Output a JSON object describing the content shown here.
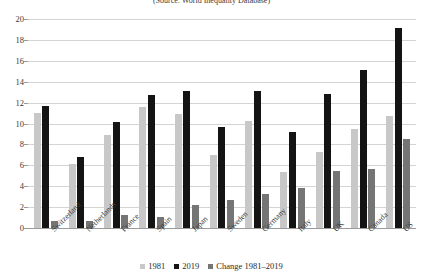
{
  "chart_data": {
    "type": "bar",
    "title": "(Source: World Inequality Database)",
    "xlabel": "",
    "ylabel": "",
    "ylim": [
      0,
      20
    ],
    "yticks": [
      0,
      2,
      4,
      6,
      8,
      10,
      12,
      14,
      16,
      18,
      20
    ],
    "grid": true,
    "legend_position": "bottom",
    "categories": [
      "Switzerland",
      "Netherlands",
      "France",
      "Spain",
      "Japan",
      "Sweden",
      "Germany",
      "Italy",
      "UK",
      "Canada",
      "US"
    ],
    "series": [
      {
        "name": "1981",
        "color": "#c8c8c8",
        "values": [
          11.0,
          6.1,
          8.9,
          11.6,
          10.9,
          7.0,
          10.2,
          5.4,
          7.3,
          9.5,
          10.7
        ]
      },
      {
        "name": "2019",
        "color": "#141414",
        "values": [
          11.7,
          6.8,
          10.1,
          12.7,
          13.1,
          9.7,
          13.1,
          9.2,
          12.8,
          15.1,
          19.1
        ]
      },
      {
        "name": "Change 1981–2019",
        "color": "#757575",
        "values": [
          0.7,
          0.7,
          1.2,
          1.1,
          2.2,
          2.7,
          3.3,
          3.8,
          5.5,
          5.6,
          8.5
        ]
      }
    ]
  },
  "colors": {
    "series_1981": "#c8c8c8",
    "series_2019": "#141414",
    "series_change": "#757575",
    "gridline": "#d4d4d4",
    "axis": "#9a9a9a",
    "text": "#2b2b2b",
    "background": "#ffffff"
  }
}
